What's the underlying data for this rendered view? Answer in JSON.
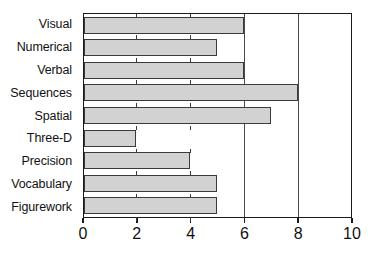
{
  "chart_data": {
    "type": "bar",
    "orientation": "horizontal",
    "title": "",
    "subtitle": "",
    "xlabel": "",
    "ylabel": "",
    "categories": [
      "Visual",
      "Numerical",
      "Verbal",
      "Sequences",
      "Spatial",
      "Three-D",
      "Precision",
      "Vocabulary",
      "Figurework"
    ],
    "values": [
      6,
      5,
      6,
      8,
      7,
      2,
      4,
      5,
      5
    ],
    "xlim": [
      0,
      10
    ],
    "xticks": [
      0,
      2,
      4,
      6,
      8,
      10
    ],
    "xtick_labels": [
      "0",
      "2",
      "4",
      "6",
      "8",
      "10"
    ],
    "gridlines_at": [
      6,
      8
    ],
    "grid": true,
    "legend": null,
    "legend_position": "none",
    "bar_fill_color": "#d2d2d2",
    "bar_edge_color": "#3a3a3a",
    "axis_color": "#1a1a1a",
    "background_color": "#ffffff"
  }
}
